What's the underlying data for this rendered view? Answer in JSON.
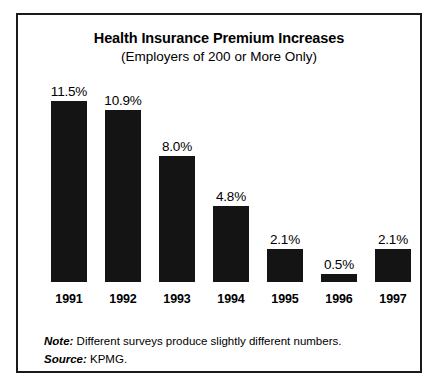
{
  "chart_data": {
    "type": "bar",
    "title": "Health Insurance Premium Increases",
    "subtitle": "(Employers of 200 or More Only)",
    "categories": [
      "1991",
      "1992",
      "1993",
      "1994",
      "1995",
      "1996",
      "1997"
    ],
    "values": [
      11.5,
      10.9,
      8.0,
      4.8,
      2.1,
      0.5,
      2.1
    ],
    "value_labels": [
      "11.5%",
      "10.9%",
      "8.0%",
      "4.8%",
      "2.1%",
      "0.5%",
      "2.1%"
    ],
    "xlabel": "",
    "ylabel": "",
    "ylim": [
      0,
      11.5
    ],
    "grid": false,
    "legend": "none",
    "bar_color": "#141414",
    "background_color": "#ffffff",
    "border_color": "#1a1a1a",
    "axis_visible": false
  },
  "footnotes": [
    {
      "label": "Note:",
      "text": "Different surveys produce slightly different numbers."
    },
    {
      "label": "Source:",
      "text": "KPMG."
    }
  ]
}
